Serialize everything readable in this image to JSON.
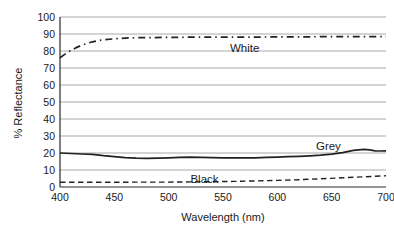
{
  "chart_data": {
    "type": "line",
    "title": "",
    "xlabel": "Wavelength (nm)",
    "ylabel": "% Reflectance",
    "xlim": [
      400,
      700
    ],
    "ylim": [
      0,
      100
    ],
    "x_ticks": [
      400,
      450,
      500,
      550,
      600,
      650,
      700
    ],
    "y_ticks": [
      0,
      10,
      20,
      30,
      40,
      50,
      60,
      70,
      80,
      90,
      100
    ],
    "grid": "horizontal-only",
    "legend_position": "inline-labels",
    "colors": {
      "line": "#222222",
      "grid": "#a8a8a8",
      "text": "#1a1a1a",
      "background": "#ffffff"
    },
    "series": [
      {
        "name": "White",
        "line_style": "dash-dot",
        "label_anchor": {
          "x": 570,
          "y": 82
        },
        "points": [
          [
            400,
            76
          ],
          [
            405,
            78.3
          ],
          [
            410,
            80.3
          ],
          [
            415,
            82
          ],
          [
            420,
            83.4
          ],
          [
            425,
            84.5
          ],
          [
            430,
            85.4
          ],
          [
            435,
            86.1
          ],
          [
            440,
            86.6
          ],
          [
            450,
            87.2
          ],
          [
            460,
            87.6
          ],
          [
            470,
            87.8
          ],
          [
            480,
            87.9
          ],
          [
            500,
            88
          ],
          [
            520,
            88.1
          ],
          [
            540,
            88.1
          ],
          [
            560,
            88.2
          ],
          [
            580,
            88.2
          ],
          [
            600,
            88.3
          ],
          [
            620,
            88.3
          ],
          [
            640,
            88.4
          ],
          [
            660,
            88.4
          ],
          [
            680,
            88.5
          ],
          [
            700,
            88.5
          ]
        ]
      },
      {
        "name": "Grey",
        "line_style": "solid",
        "label_anchor": {
          "x": 647,
          "y": 24.3
        },
        "points": [
          [
            400,
            20
          ],
          [
            410,
            19.7
          ],
          [
            420,
            19.4
          ],
          [
            430,
            19.2
          ],
          [
            440,
            18.4
          ],
          [
            450,
            17.9
          ],
          [
            460,
            17.3
          ],
          [
            470,
            17
          ],
          [
            480,
            16.9
          ],
          [
            490,
            17
          ],
          [
            500,
            17.2
          ],
          [
            510,
            17.4
          ],
          [
            520,
            17.6
          ],
          [
            530,
            17.5
          ],
          [
            540,
            17.3
          ],
          [
            550,
            17.2
          ],
          [
            560,
            17.1
          ],
          [
            570,
            17.1
          ],
          [
            580,
            17.2
          ],
          [
            590,
            17.4
          ],
          [
            600,
            17.6
          ],
          [
            610,
            17.8
          ],
          [
            620,
            18
          ],
          [
            630,
            18.3
          ],
          [
            640,
            18.7
          ],
          [
            650,
            19.3
          ],
          [
            660,
            20.2
          ],
          [
            670,
            21.5
          ],
          [
            680,
            22.2
          ],
          [
            685,
            21.8
          ],
          [
            690,
            21.3
          ],
          [
            695,
            21.2
          ],
          [
            700,
            21.3
          ]
        ]
      },
      {
        "name": "Black",
        "line_style": "dashed",
        "label_anchor": {
          "x": 533,
          "y": 4.8
        },
        "points": [
          [
            400,
            2.8
          ],
          [
            420,
            2.8
          ],
          [
            440,
            2.8
          ],
          [
            460,
            2.8
          ],
          [
            480,
            2.9
          ],
          [
            500,
            2.9
          ],
          [
            520,
            3
          ],
          [
            540,
            3.1
          ],
          [
            560,
            3.3
          ],
          [
            580,
            3.6
          ],
          [
            600,
            3.9
          ],
          [
            620,
            4.3
          ],
          [
            640,
            4.8
          ],
          [
            660,
            5.4
          ],
          [
            680,
            6
          ],
          [
            700,
            6.6
          ]
        ]
      }
    ]
  }
}
